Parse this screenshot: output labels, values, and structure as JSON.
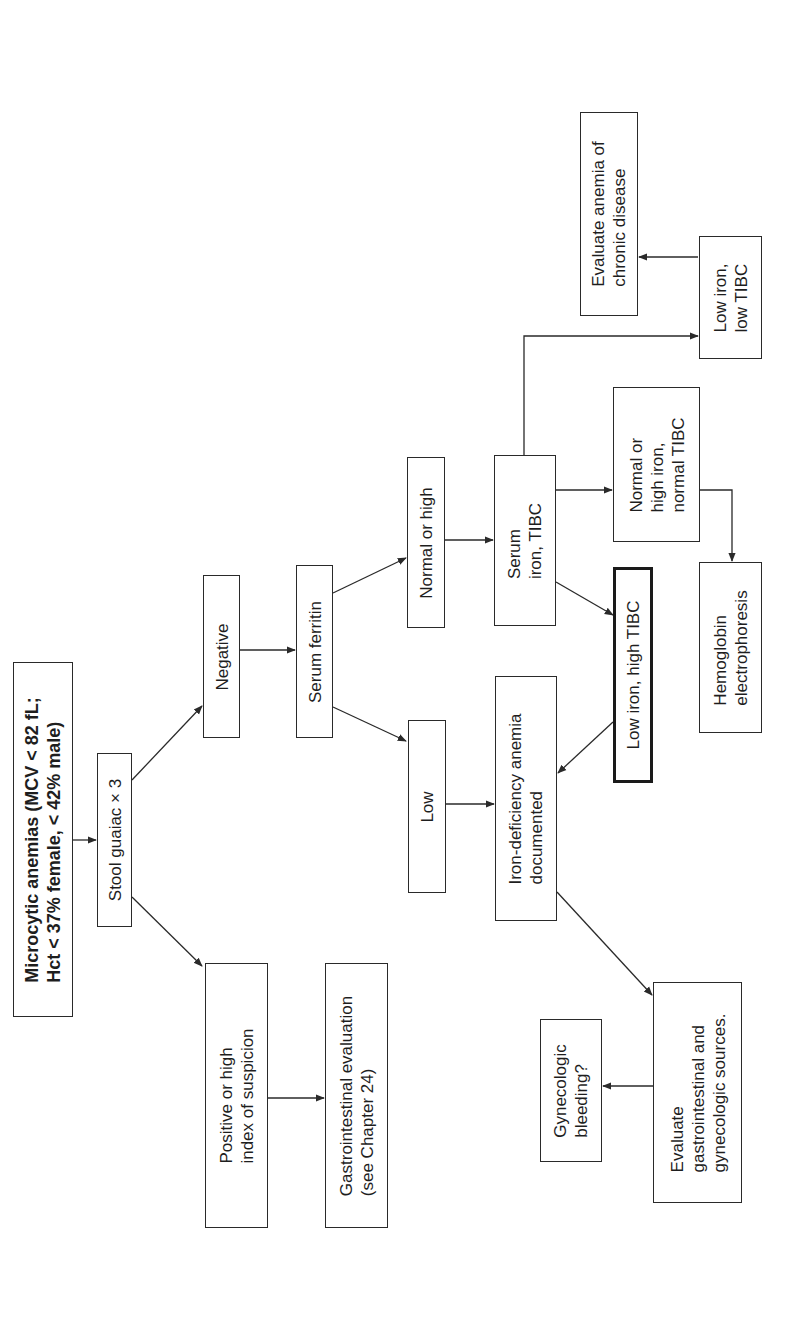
{
  "diagram": {
    "orientation": "rotated-90-ccw",
    "nodes": {
      "title": {
        "label": "Microcytic anemias (MCV < 82 fL;\nHct < 37% female, < 42% male)"
      },
      "stool_guaiac": {
        "label": "Stool guaiac × 3"
      },
      "positive": {
        "label": "Positive or high\nindex of suspicion"
      },
      "gi_evaluation": {
        "label": "Gastrointestinal evaluation\n(see Chapter 24)"
      },
      "negative": {
        "label": "Negative"
      },
      "serum_ferritin": {
        "label": "Serum ferritin"
      },
      "normal_or_high": {
        "label": "Normal or high"
      },
      "low": {
        "label": "Low"
      },
      "serum_iron_tibc": {
        "label": "Serum\niron, TIBC"
      },
      "iron_deficiency": {
        "label": "Iron-deficiency anemia\ndocumented"
      },
      "low_iron_high_tibc": {
        "label": "Low iron, high TIBC"
      },
      "normal_high_iron_normal_tibc": {
        "label": "Normal or\nhigh iron,\nnormal TIBC"
      },
      "low_iron_low_tibc": {
        "label": "Low iron,\nlow TIBC"
      },
      "chronic_disease": {
        "label": "Evaluate anemia of\nchronic disease"
      },
      "hemoglobin_electrophoresis": {
        "label": "Hemoglobin\nelectrophoresis"
      },
      "evaluate_gi_gyn": {
        "label": "Evaluate\ngastrointestinal and\ngynecologic sources."
      },
      "gyn_bleeding": {
        "label": "Gynecologic\nbleeding?"
      }
    },
    "edges": [
      {
        "from": "title",
        "to": "stool_guaiac"
      },
      {
        "from": "stool_guaiac",
        "to": "negative"
      },
      {
        "from": "stool_guaiac",
        "to": "positive"
      },
      {
        "from": "positive",
        "to": "gi_evaluation"
      },
      {
        "from": "negative",
        "to": "serum_ferritin"
      },
      {
        "from": "serum_ferritin",
        "to": "normal_or_high"
      },
      {
        "from": "serum_ferritin",
        "to": "low"
      },
      {
        "from": "normal_or_high",
        "to": "serum_iron_tibc"
      },
      {
        "from": "low",
        "to": "iron_deficiency"
      },
      {
        "from": "serum_iron_tibc",
        "to": "low_iron_low_tibc"
      },
      {
        "from": "serum_iron_tibc",
        "to": "normal_high_iron_normal_tibc"
      },
      {
        "from": "serum_iron_tibc",
        "to": "low_iron_high_tibc"
      },
      {
        "from": "low_iron_high_tibc",
        "to": "iron_deficiency"
      },
      {
        "from": "low_iron_low_tibc",
        "to": "chronic_disease"
      },
      {
        "from": "normal_high_iron_normal_tibc",
        "to": "hemoglobin_electrophoresis"
      },
      {
        "from": "iron_deficiency",
        "to": "evaluate_gi_gyn"
      },
      {
        "from": "evaluate_gi_gyn",
        "to": "gyn_bleeding"
      }
    ],
    "colors": {
      "line": "#2a2a2a",
      "text": "#1e1e1e",
      "background": "#ffffff"
    }
  }
}
